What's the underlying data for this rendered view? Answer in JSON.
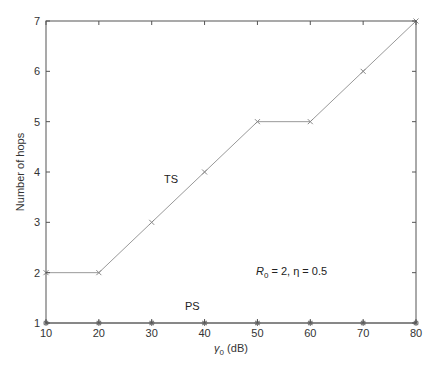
{
  "chart_data": {
    "type": "line",
    "title": "",
    "xlabel": "γ0 (dB)",
    "ylabel": "Number of hops",
    "xlim": [
      10,
      80
    ],
    "ylim": [
      1,
      7
    ],
    "xticks": [
      10,
      20,
      30,
      40,
      50,
      60,
      70,
      80
    ],
    "yticks": [
      1,
      2,
      3,
      4,
      5,
      6,
      7
    ],
    "grid": false,
    "x": [
      10,
      20,
      30,
      40,
      50,
      60,
      70,
      80
    ],
    "series": [
      {
        "name": "TS",
        "marker": "x",
        "color": "#999999",
        "values": [
          2,
          2,
          3,
          4,
          5,
          5,
          6,
          7
        ]
      },
      {
        "name": "PS",
        "marker": "*",
        "color": "#777777",
        "values": [
          1,
          1,
          1,
          1,
          1,
          1,
          1,
          1
        ]
      }
    ],
    "annotations": [
      {
        "text": "TS",
        "x": 37,
        "y": 3.8
      },
      {
        "text": "PS",
        "x": 37,
        "y": 1.3
      },
      {
        "text": "R0 = 2, η = 0.5",
        "x": 65,
        "y": 2.3
      }
    ]
  },
  "labels": {
    "xlabel_main": "γ",
    "xlabel_sub": "0",
    "xlabel_unit": " (dB)",
    "ylabel": "Number of hops",
    "ts": "TS",
    "ps": "PS",
    "param_R": "R",
    "param_R_sub": "0",
    "param_rest": " = 2, η = 0.5"
  }
}
